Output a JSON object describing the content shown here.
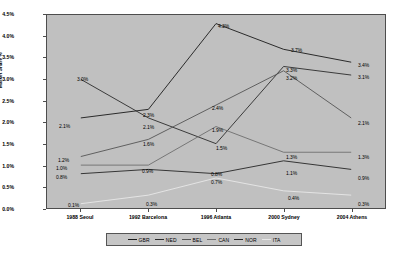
{
  "chart_data": {
    "type": "line",
    "title": "",
    "xlabel": "",
    "ylabel": "Market Share %",
    "ylim": [
      0,
      4.5
    ],
    "ytick_labels": [
      "4.5%",
      "4.0%",
      "3.5%",
      "3.0%",
      "2.5%",
      "2.0%",
      "1.5%",
      "1.0%",
      "0.5%",
      "0.0%"
    ],
    "ytick_values": [
      4.5,
      4.0,
      3.5,
      3.0,
      2.5,
      2.0,
      1.5,
      1.0,
      0.5,
      0.0
    ],
    "grid": false,
    "legend_position": "bottom",
    "categories": [
      "1988 Seoul",
      "1992 Barcelona",
      "1996 Atlanta",
      "2000 Sydney",
      "2004 Athens"
    ],
    "series": [
      {
        "name": "GBR",
        "color": "#1a1a1a",
        "values": [
          2.1,
          2.3,
          4.3,
          3.7,
          3.4
        ],
        "labels": [
          "2.1%",
          "2.3%",
          "4.3%",
          "3.7%",
          "3.4%"
        ]
      },
      {
        "name": "NED",
        "color": "#2b2b2b",
        "values": [
          3.0,
          2.1,
          1.5,
          3.3,
          3.1
        ],
        "labels": [
          "3.0%",
          "2.1%",
          "1.5%",
          "3.3%",
          "3.1%"
        ]
      },
      {
        "name": "BEL",
        "color": "#555555",
        "values": [
          1.2,
          1.6,
          2.4,
          3.2,
          2.1
        ],
        "labels": [
          "1.2%",
          "1.6%",
          "2.4%",
          "3.2%",
          "2.1%"
        ]
      },
      {
        "name": "CAN",
        "color": "#6e6e6e",
        "values": [
          1.0,
          1.0,
          1.9,
          1.3,
          1.3
        ],
        "labels": [
          "1.0%",
          "",
          "1.9%",
          "1.3%",
          "1.3%"
        ]
      },
      {
        "name": "NOR",
        "color": "#262626",
        "values": [
          0.8,
          0.9,
          0.8,
          1.1,
          0.9
        ],
        "labels": [
          "0.8%",
          "0.9%",
          "0.8%",
          "1.1%",
          "0.9%"
        ]
      },
      {
        "name": "ITA",
        "color": "#e8e8e8",
        "values": [
          0.1,
          0.3,
          0.7,
          0.4,
          0.3
        ],
        "labels": [
          "0.1%",
          "0.3%",
          "0.7%",
          "0.4%",
          "0.3%"
        ]
      }
    ],
    "point_labels": [
      {
        "text": "3.0%",
        "x": 77,
        "y": 77
      },
      {
        "text": "2.1%",
        "x": 59,
        "y": 124
      },
      {
        "text": "1.2%",
        "x": 58,
        "y": 158
      },
      {
        "text": "1.0%",
        "x": 56,
        "y": 166
      },
      {
        "text": "0.8%",
        "x": 56,
        "y": 175
      },
      {
        "text": "0.1%",
        "x": 68,
        "y": 203
      },
      {
        "text": "2.3%",
        "x": 143,
        "y": 113
      },
      {
        "text": "2.1%",
        "x": 143,
        "y": 125
      },
      {
        "text": "1.6%",
        "x": 143,
        "y": 142
      },
      {
        "text": "0.9%",
        "x": 142,
        "y": 169
      },
      {
        "text": "0.3%",
        "x": 146,
        "y": 202
      },
      {
        "text": "4.3%",
        "x": 218,
        "y": 24
      },
      {
        "text": "2.4%",
        "x": 212,
        "y": 106
      },
      {
        "text": "1.9%",
        "x": 212,
        "y": 128
      },
      {
        "text": "1.5%",
        "x": 216,
        "y": 146
      },
      {
        "text": "0.8%",
        "x": 211,
        "y": 172
      },
      {
        "text": "0.7%",
        "x": 211,
        "y": 180
      },
      {
        "text": "3.7%",
        "x": 291,
        "y": 48
      },
      {
        "text": "3.3%",
        "x": 286,
        "y": 68
      },
      {
        "text": "3.2%",
        "x": 286,
        "y": 76
      },
      {
        "text": "1.3%",
        "x": 286,
        "y": 155
      },
      {
        "text": "1.1%",
        "x": 286,
        "y": 171
      },
      {
        "text": "0.4%",
        "x": 288,
        "y": 196
      },
      {
        "text": "3.4%",
        "x": 358,
        "y": 63
      },
      {
        "text": "3.1%",
        "x": 358,
        "y": 75
      },
      {
        "text": "2.1%",
        "x": 358,
        "y": 121
      },
      {
        "text": "1.3%",
        "x": 358,
        "y": 155
      },
      {
        "text": "0.9%",
        "x": 358,
        "y": 176
      },
      {
        "text": "0.3%",
        "x": 358,
        "y": 202
      }
    ]
  },
  "axis": {
    "y_title": "Market Share %"
  },
  "legend": {
    "items": [
      {
        "label": "GBR",
        "color": "#1a1a1a"
      },
      {
        "label": "NED",
        "color": "#2b2b2b"
      },
      {
        "label": "BEL",
        "color": "#555555"
      },
      {
        "label": "CAN",
        "color": "#6e6e6e"
      },
      {
        "label": "NOR",
        "color": "#262626"
      },
      {
        "label": "ITA",
        "color": "#e8e8e8"
      }
    ]
  }
}
